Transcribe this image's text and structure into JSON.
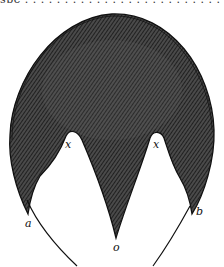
{
  "header_fragment": "spe . . . . . . . . . . . . . . . . . . . . . . . . . . . . . . . p",
  "figure": {
    "fill_color": "#3a3a3a",
    "hatch_color": "#1a1a1a",
    "outline_color": "#111111",
    "labels": {
      "left_notch": "x",
      "right_notch": "x",
      "left_tip": "a",
      "right_tip": "b",
      "center_tip": "o"
    }
  }
}
